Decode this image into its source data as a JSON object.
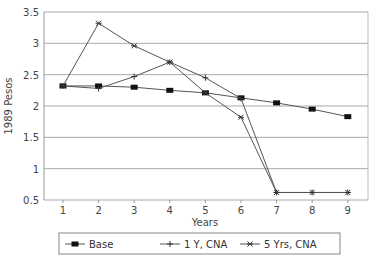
{
  "chart_data": {
    "type": "line",
    "title": "",
    "xlabel": "Years",
    "ylabel": "1989 Pesos",
    "x": [
      1,
      2,
      3,
      4,
      5,
      6,
      7,
      8,
      9
    ],
    "ylim": [
      0.5,
      3.5
    ],
    "yticks": [
      "0.5",
      "1",
      "1.5",
      "2",
      "2.5",
      "3",
      "3.5"
    ],
    "xticks": [
      "1",
      "2",
      "3",
      "4",
      "5",
      "6",
      "7",
      "8",
      "9"
    ],
    "grid": "horizontal",
    "legend_position": "bottom",
    "series": [
      {
        "name": "Base",
        "marker": "filled-square",
        "values": [
          2.32,
          2.32,
          2.3,
          2.25,
          2.21,
          2.13,
          2.05,
          1.95,
          1.83
        ]
      },
      {
        "name": "1 Y,  CNA",
        "marker": "plus",
        "values": [
          2.32,
          2.28,
          2.47,
          2.7,
          2.45,
          2.12,
          0.62,
          0.62,
          0.62
        ]
      },
      {
        "name": "5 Yrs,  CNA",
        "marker": "star",
        "values": [
          2.32,
          3.32,
          2.96,
          2.7,
          2.21,
          1.82,
          0.62,
          0.62,
          0.62
        ]
      }
    ]
  }
}
